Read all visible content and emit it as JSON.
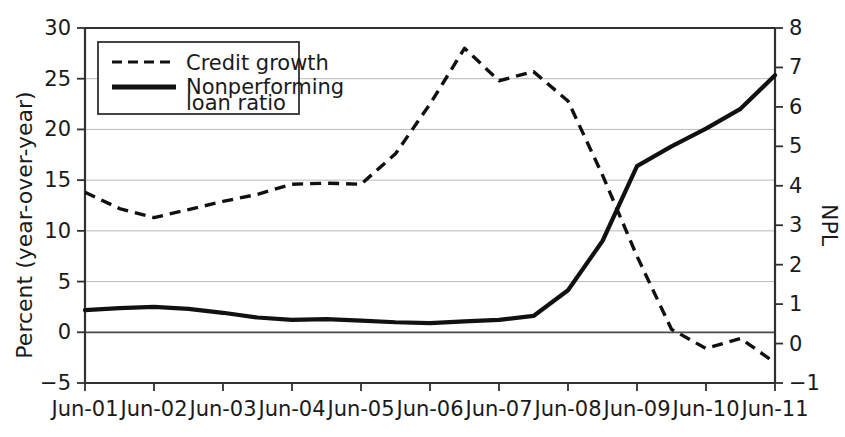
{
  "chart_data": {
    "type": "line",
    "title": "",
    "xlabel": "",
    "ylabel": "Percent (year-over-year)",
    "y2label": "NPL",
    "grid": true,
    "legend_position": "top-left",
    "x_tick_labels": [
      "Jun-01",
      "Jun-02",
      "Jun-03",
      "Jun-04",
      "Jun-05",
      "Jun-06",
      "Jun-07",
      "Jun-08",
      "Jun-09",
      "Jun-10",
      "Jun-11"
    ],
    "y_tick_labels": [
      "30",
      "25",
      "20",
      "15",
      "10",
      "5",
      "0",
      "-5"
    ],
    "y_ticks": [
      30,
      25,
      20,
      15,
      10,
      5,
      0,
      -5
    ],
    "ylim": [
      -5,
      30
    ],
    "y2_tick_labels": [
      "8",
      "7",
      "6",
      "5",
      "4",
      "3",
      "2",
      "1",
      "0",
      "-1"
    ],
    "y2_ticks": [
      8,
      7,
      6,
      5,
      4,
      3,
      2,
      1,
      0,
      -1
    ],
    "y2lim": [
      -1,
      8
    ],
    "x": [
      "Jun-01",
      "Dec-01",
      "Jun-02",
      "Dec-02",
      "Jun-03",
      "Dec-03",
      "Jun-04",
      "Dec-04",
      "Jun-05",
      "Dec-05",
      "Jun-06",
      "Dec-06",
      "Jun-07",
      "Dec-07",
      "Jun-08",
      "Dec-08",
      "Jun-09",
      "Dec-09",
      "Jun-10",
      "Dec-10",
      "Jun-11"
    ],
    "series": [
      {
        "name": "Credit growth",
        "axis": "left",
        "style": "dashed",
        "unit": "percent year-over-year",
        "values": [
          13.8,
          12.2,
          11.3,
          12.1,
          12.9,
          13.6,
          14.6,
          14.7,
          14.6,
          17.6,
          22.5,
          28.0,
          24.8,
          25.7,
          22.8,
          15.5,
          7.5,
          0.3,
          -1.6,
          -0.6,
          -3.0
        ]
      },
      {
        "name": "Nonperforming loan ratio",
        "axis": "right",
        "style": "solid",
        "unit": "NPL ratio",
        "values": [
          0.85,
          0.9,
          0.93,
          0.88,
          0.78,
          0.66,
          0.6,
          0.62,
          0.58,
          0.54,
          0.52,
          0.56,
          0.6,
          0.7,
          1.35,
          2.6,
          4.5,
          5.0,
          5.45,
          5.95,
          6.8
        ]
      }
    ],
    "legend_entries": [
      {
        "label": "Credit growth",
        "style": "dashed"
      },
      {
        "label": "Nonperforming\nloan ratio",
        "style": "solid"
      }
    ],
    "annotations": []
  },
  "legend": {
    "entry_1_line_1": "Credit growth",
    "entry_2_line_1": "Nonperforming",
    "entry_2_line_2": "loan ratio"
  },
  "axes": {
    "left_title": "Percent (year-over-year)",
    "right_title": "NPL",
    "y_labels": [
      "30",
      "25",
      "20",
      "15",
      "10",
      "5",
      "0",
      "-5"
    ],
    "y2_labels": [
      "8",
      "7",
      "6",
      "5",
      "4",
      "3",
      "2",
      "1",
      "0",
      "-1"
    ],
    "x_labels": [
      "Jun-01",
      "Jun-02",
      "Jun-03",
      "Jun-04",
      "Jun-05",
      "Jun-06",
      "Jun-07",
      "Jun-08",
      "Jun-09",
      "Jun-10",
      "Jun-11"
    ]
  },
  "colors": {
    "line": "#111111",
    "grid": "#b9b9b9",
    "frame": "#303030",
    "background": "#ffffff"
  }
}
